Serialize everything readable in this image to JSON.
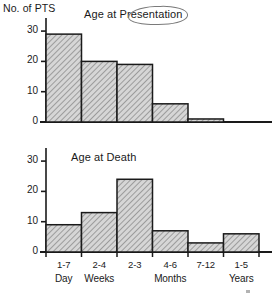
{
  "figure": {
    "ylabel": "No. of PTS",
    "background": "#ffffff",
    "ink": "#1a1a1a",
    "bar_fill": "#d6d6d6",
    "annotation_color": "#7a7a7a"
  },
  "chart_data": [
    {
      "type": "bar",
      "title": "Age at Presentation",
      "categories": [
        "1-7 Day",
        "2-4 Weeks",
        "2-3 Months",
        "4-6 Months",
        "7-12 Months",
        "1-5 Years"
      ],
      "values": [
        29,
        20,
        19,
        6,
        1,
        0
      ],
      "xlabel": "",
      "ylabel": "No. of PTS",
      "ylim": [
        0,
        33
      ],
      "yticks": [
        0,
        10,
        20,
        30
      ],
      "ytick_labels": [
        "0",
        "10",
        "20",
        "30"
      ],
      "grid": false,
      "legend": "none",
      "annotation": "Presentation circled by hand"
    },
    {
      "type": "bar",
      "title": "Age at Death",
      "categories": [
        "1-7 Day",
        "2-4 Weeks",
        "2-3 Months",
        "4-6 Months",
        "7-12 Months",
        "1-5 Years"
      ],
      "values": [
        9,
        13,
        24,
        7,
        3,
        6
      ],
      "xlabel": "",
      "ylabel": "No. of PTS",
      "ylim": [
        0,
        33
      ],
      "yticks": [
        0,
        10,
        20,
        30
      ],
      "ytick_labels": [
        "0",
        "10",
        "20",
        "30"
      ],
      "grid": false,
      "legend": "none",
      "xtick_ranges": [
        "1-7",
        "2-4",
        "2-3",
        "4-6",
        "7-12",
        "1-5"
      ],
      "xtick_groups": [
        "Day",
        "Weeks",
        "",
        "Months",
        "",
        "Years"
      ]
    }
  ]
}
